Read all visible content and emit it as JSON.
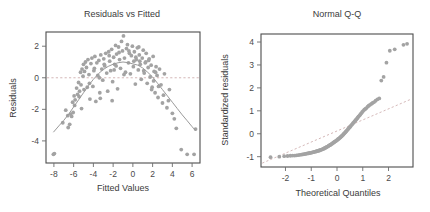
{
  "figure": {
    "background_color": "#ffffff",
    "point_color": "#a3a3a3",
    "line_color": "#9a9a9a",
    "ref_line_color": "#c9a6a6",
    "frame_color": "#4d4d4d",
    "text_color": "#3b3b3b"
  },
  "chart_data": [
    {
      "type": "scatter",
      "title": "Residuals vs Fitted",
      "xlabel": "Fitted Values",
      "ylabel": "Residuals",
      "xlim": [
        -8.8,
        6.8
      ],
      "ylim": [
        -5.4,
        2.9
      ],
      "xticks": [
        -8,
        -6,
        -4,
        -2,
        0,
        2,
        4,
        6
      ],
      "xticklabels": [
        "-8",
        "-6",
        "-4",
        "-2",
        "0",
        "2",
        "4",
        "6"
      ],
      "yticks": [
        2,
        0,
        -2,
        -4
      ],
      "yticklabels": [
        "2",
        "0",
        "-2",
        "-4"
      ],
      "grid": false,
      "legend": "none",
      "reference_line": {
        "type": "horizontal",
        "y": 0,
        "style": "dashed"
      },
      "smoother": {
        "name": "loess",
        "style": "solid",
        "points": [
          [
            -8.05,
            -3.45
          ],
          [
            -7.5,
            -3.05
          ],
          [
            -7.0,
            -2.7
          ],
          [
            -6.5,
            -2.3
          ],
          [
            -6.0,
            -1.85
          ],
          [
            -5.5,
            -1.4
          ],
          [
            -5.0,
            -0.95
          ],
          [
            -4.5,
            -0.5
          ],
          [
            -4.0,
            -0.1
          ],
          [
            -3.5,
            0.25
          ],
          [
            -3.0,
            0.52
          ],
          [
            -2.5,
            0.72
          ],
          [
            -2.0,
            0.86
          ],
          [
            -1.5,
            0.95
          ],
          [
            -1.0,
            1.0
          ],
          [
            -0.5,
            0.96
          ],
          [
            0.0,
            0.88
          ],
          [
            0.5,
            0.8
          ],
          [
            1.0,
            0.62
          ],
          [
            1.5,
            0.35
          ],
          [
            2.0,
            0.05
          ],
          [
            2.5,
            -0.35
          ],
          [
            3.0,
            -0.75
          ],
          [
            3.5,
            -1.15
          ],
          [
            4.0,
            -1.55
          ],
          [
            4.5,
            -1.95
          ],
          [
            5.0,
            -2.35
          ],
          [
            5.5,
            -2.72
          ],
          [
            6.0,
            -3.1
          ],
          [
            6.35,
            -3.35
          ]
        ]
      },
      "x": [
        -8.05,
        -7.1,
        -6.55,
        -6.4,
        -6.3,
        -6.2,
        -6.1,
        -6.05,
        -5.95,
        -5.85,
        -5.7,
        -5.6,
        -5.5,
        -5.4,
        -5.3,
        -5.25,
        -5.15,
        -5.05,
        -5.0,
        -4.9,
        -4.8,
        -4.7,
        -4.62,
        -4.55,
        -4.45,
        -4.35,
        -4.25,
        -4.15,
        -4.05,
        -3.95,
        -3.85,
        -3.75,
        -3.65,
        -3.55,
        -3.45,
        -3.35,
        -3.25,
        -3.15,
        -3.05,
        -2.95,
        -2.85,
        -2.75,
        -2.65,
        -2.55,
        -2.45,
        -2.35,
        -2.25,
        -2.15,
        -2.05,
        -1.95,
        -1.85,
        -1.75,
        -1.65,
        -1.55,
        -1.45,
        -1.35,
        -1.25,
        -1.15,
        -1.05,
        -0.95,
        -0.85,
        -0.75,
        -0.65,
        -0.55,
        -0.45,
        -0.35,
        -0.25,
        -0.15,
        -0.05,
        0.05,
        0.15,
        0.25,
        0.35,
        0.45,
        0.55,
        0.65,
        0.75,
        0.85,
        0.95,
        1.05,
        1.15,
        1.25,
        1.35,
        1.45,
        1.55,
        1.65,
        1.75,
        1.85,
        1.95,
        2.05,
        2.15,
        2.25,
        2.35,
        2.45,
        2.55,
        2.7,
        2.85,
        3.0,
        3.2,
        3.45,
        3.7,
        4.0,
        4.4,
        4.9,
        5.5,
        6.2,
        6.35,
        -7.95,
        -6.8,
        -5.9,
        -5.45,
        -4.95,
        -4.4,
        -3.9,
        -3.4,
        -2.9,
        -2.4,
        -1.9,
        -1.4,
        -0.9,
        -0.4,
        0.1,
        0.6,
        1.1,
        1.6,
        2.1,
        2.6,
        3.1,
        3.6,
        4.2,
        -6.6,
        -5.2,
        -3.3,
        -1.7,
        0.3,
        1.3,
        2.3,
        -2.1,
        0.7,
        1.9
      ],
      "y": [
        -4.85,
        -2.85,
        -3.15,
        -2.95,
        -2.3,
        -2.45,
        -1.55,
        -2.2,
        -1.15,
        -1.4,
        -0.65,
        -1.05,
        -0.3,
        -0.85,
        0.35,
        -0.45,
        0.55,
        0.1,
        0.85,
        0.4,
        1.0,
        0.65,
        -0.6,
        1.15,
        0.2,
        -1.35,
        0.9,
        1.25,
        -0.55,
        0.45,
        1.35,
        -1.5,
        0.95,
        0.15,
        1.1,
        -0.95,
        1.45,
        0.55,
        -0.15,
        1.2,
        0.75,
        1.55,
        0.3,
        -0.85,
        1.65,
        1.05,
        0.45,
        1.8,
        -0.25,
        1.3,
        0.85,
        2.05,
        1.5,
        -0.7,
        1.95,
        1.15,
        0.6,
        2.3,
        1.7,
        2.65,
        1.25,
        0.35,
        1.85,
        2.1,
        0.95,
        1.55,
        0.25,
        1.4,
        2.0,
        0.7,
        1.65,
        -0.4,
        1.15,
        1.9,
        0.5,
        1.45,
        0.85,
        -0.1,
        1.25,
        1.75,
        0.3,
        0.95,
        1.55,
        -0.35,
        0.65,
        1.2,
        0.05,
        0.8,
        -0.6,
        1.35,
        0.4,
        -0.95,
        0.7,
        0.15,
        -1.25,
        0.55,
        -0.45,
        -1.6,
        0.25,
        -1.9,
        -0.75,
        -2.25,
        -3.2,
        -4.55,
        -4.85,
        -4.85,
        -3.25,
        -4.8,
        -2.05,
        -1.75,
        -1.2,
        -0.75,
        -0.35,
        0.6,
        0.0,
        0.85,
        1.4,
        0.5,
        1.6,
        0.2,
        1.7,
        1.05,
        1.95,
        0.45,
        1.1,
        -0.2,
        -0.55,
        -1.1,
        -1.45,
        -2.6,
        -2.4,
        -1.95,
        -1.3,
        0.75,
        1.3,
        1.0,
        0.35,
        -1.45,
        1.05,
        -0.75
      ]
    },
    {
      "type": "scatter",
      "title": "Normal Q-Q",
      "xlabel": "Theoretical Quantiles",
      "ylabel": "Standardized residuals",
      "xlim": [
        -2.95,
        2.95
      ],
      "ylim": [
        -1.45,
        4.35
      ],
      "xticks": [
        -2,
        -1,
        0,
        1,
        2
      ],
      "xticklabels": [
        "-2",
        "-1",
        "0",
        "1",
        "2"
      ],
      "yticks": [
        4,
        3,
        2,
        1,
        0,
        -1
      ],
      "yticklabels": [
        "4",
        "3",
        "2",
        "1",
        "0",
        "-1"
      ],
      "grid": false,
      "legend": "none",
      "reference_line": {
        "type": "qq-line",
        "style": "dashed",
        "p1": [
          -2.9,
          -1.28
        ],
        "p2": [
          2.9,
          1.52
        ]
      },
      "x": [
        -2.58,
        -2.24,
        -2.05,
        -1.92,
        -1.81,
        -1.72,
        -1.64,
        -1.57,
        -1.5,
        -1.44,
        -1.38,
        -1.33,
        -1.28,
        -1.23,
        -1.19,
        -1.14,
        -1.1,
        -1.06,
        -1.02,
        -0.98,
        -0.95,
        -0.91,
        -0.88,
        -0.84,
        -0.81,
        -0.78,
        -0.75,
        -0.72,
        -0.69,
        -0.66,
        -0.63,
        -0.6,
        -0.57,
        -0.54,
        -0.51,
        -0.49,
        -0.46,
        -0.43,
        -0.41,
        -0.38,
        -0.35,
        -0.33,
        -0.3,
        -0.28,
        -0.25,
        -0.23,
        -0.2,
        -0.18,
        -0.15,
        -0.13,
        -0.1,
        -0.08,
        -0.05,
        -0.03,
        0.0,
        0.03,
        0.05,
        0.08,
        0.1,
        0.13,
        0.15,
        0.18,
        0.2,
        0.23,
        0.25,
        0.28,
        0.3,
        0.33,
        0.35,
        0.38,
        0.41,
        0.43,
        0.46,
        0.49,
        0.51,
        0.54,
        0.57,
        0.6,
        0.63,
        0.66,
        0.69,
        0.72,
        0.75,
        0.78,
        0.81,
        0.84,
        0.88,
        0.91,
        0.95,
        0.98,
        1.02,
        1.06,
        1.1,
        1.14,
        1.19,
        1.23,
        1.28,
        1.33,
        1.38,
        1.44,
        1.5,
        1.57,
        1.64,
        1.72,
        1.81,
        1.92,
        2.05,
        2.24,
        2.58,
        2.72
      ],
      "y": [
        -1.02,
        -1.0,
        -0.98,
        -0.97,
        -0.96,
        -0.95,
        -0.95,
        -0.94,
        -0.93,
        -0.92,
        -0.91,
        -0.9,
        -0.89,
        -0.88,
        -0.87,
        -0.86,
        -0.85,
        -0.84,
        -0.83,
        -0.82,
        -0.81,
        -0.8,
        -0.79,
        -0.78,
        -0.77,
        -0.76,
        -0.75,
        -0.74,
        -0.73,
        -0.72,
        -0.7,
        -0.69,
        -0.68,
        -0.66,
        -0.65,
        -0.63,
        -0.62,
        -0.6,
        -0.58,
        -0.57,
        -0.55,
        -0.53,
        -0.51,
        -0.5,
        -0.48,
        -0.46,
        -0.44,
        -0.42,
        -0.4,
        -0.38,
        -0.36,
        -0.34,
        -0.32,
        -0.3,
        -0.28,
        -0.25,
        -0.23,
        -0.21,
        -0.18,
        -0.16,
        -0.13,
        -0.11,
        -0.08,
        -0.05,
        -0.02,
        0.01,
        0.04,
        0.07,
        0.1,
        0.14,
        0.17,
        0.21,
        0.24,
        0.28,
        0.31,
        0.35,
        0.39,
        0.43,
        0.47,
        0.51,
        0.55,
        0.59,
        0.63,
        0.67,
        0.71,
        0.76,
        0.8,
        0.85,
        0.9,
        0.95,
        1.0,
        1.05,
        1.08,
        1.12,
        1.18,
        1.22,
        1.26,
        1.3,
        1.34,
        1.38,
        1.44,
        1.5,
        1.54,
        2.32,
        2.48,
        3.1,
        3.62,
        3.68,
        3.88,
        3.92
      ]
    }
  ]
}
